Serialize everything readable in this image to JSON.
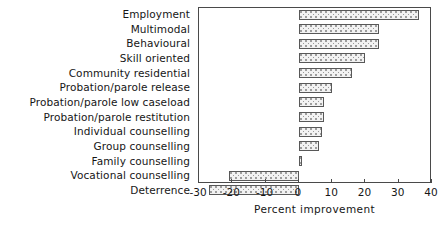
{
  "chart_data": {
    "type": "bar",
    "orientation": "horizontal",
    "title": "",
    "xlabel": "Percent improvement",
    "ylabel": "",
    "xlim": [
      -30,
      40
    ],
    "xticks": [
      -30,
      -20,
      -10,
      0,
      10,
      20,
      30,
      40
    ],
    "xticklabels": [
      "-30",
      "-20",
      "-10",
      "0",
      "10",
      "20",
      "30",
      "40"
    ],
    "grid": false,
    "legend": null,
    "categories": [
      "Employment",
      "Multimodal",
      "Behavioural",
      "Skill oriented",
      "Community residential",
      "Probation/parole release",
      "Probation/parole low caseload",
      "Probation/parole restitution",
      "Individual counselling",
      "Group counselling",
      "Family counselling",
      "Vocational counselling",
      "Deterrence"
    ],
    "values": [
      36,
      24,
      24,
      20,
      16,
      10,
      7.5,
      7.5,
      7,
      6,
      1,
      -21,
      -27
    ],
    "bar_fill_color": "#f2f2f2",
    "bar_edge_color": "#585858",
    "bar_pattern": "stipple-dots",
    "axis_color": "#4a4a4a"
  }
}
